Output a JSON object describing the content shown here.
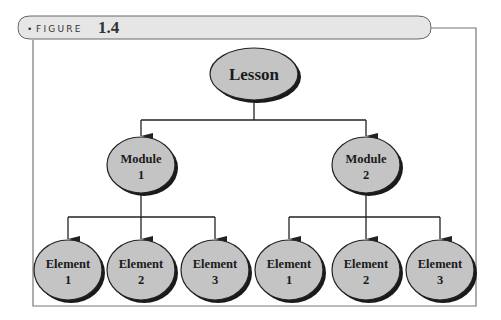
{
  "figure": {
    "label": "FIGURE",
    "number": "1.4",
    "bullet": "•"
  },
  "diagram": {
    "type": "hierarchy",
    "root": {
      "line1": "Lesson"
    },
    "modules": [
      {
        "line1": "Module",
        "line2": "1",
        "elements": [
          {
            "line1": "Element",
            "line2": "1"
          },
          {
            "line1": "Element",
            "line2": "2"
          },
          {
            "line1": "Element",
            "line2": "3"
          }
        ]
      },
      {
        "line1": "Module",
        "line2": "2",
        "elements": [
          {
            "line1": "Element",
            "line2": "1"
          },
          {
            "line1": "Element",
            "line2": "2"
          },
          {
            "line1": "Element",
            "line2": "3"
          }
        ]
      }
    ]
  },
  "colors": {
    "node_fill": "#c4c4c4",
    "node_stroke": "#222222",
    "shadow": "#1a1a1a",
    "header_fill": "#e6e6e6",
    "frame": "#777777"
  }
}
